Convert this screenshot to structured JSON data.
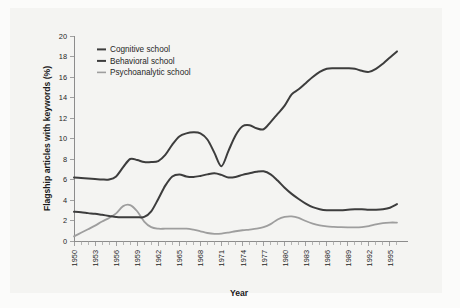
{
  "figure": {
    "background_color": "#f4f4f2",
    "page_color": "#fbfbfa"
  },
  "chart_data": {
    "type": "line",
    "title": "",
    "subtitle": "",
    "xlabel": "Year",
    "ylabel": "Flagship articles with keywords (%)",
    "xlim": [
      1950,
      1997
    ],
    "ylim": [
      0,
      20
    ],
    "yticks": [
      0,
      2,
      4,
      6,
      8,
      10,
      12,
      14,
      16,
      18,
      20
    ],
    "ytick_labels": [
      "0",
      "2",
      "4",
      "6",
      "8",
      "10",
      "12",
      "14",
      "16",
      "18",
      "20"
    ],
    "xticks": [
      1950,
      1953,
      1956,
      1959,
      1962,
      1965,
      1968,
      1971,
      1974,
      1977,
      1980,
      1983,
      1986,
      1989,
      1992,
      1995
    ],
    "xtick_labels": [
      "1950",
      "1953",
      "1956",
      "1959",
      "1962",
      "1965",
      "1968",
      "1971",
      "1974",
      "1977",
      "1980",
      "1983",
      "1986",
      "1989",
      "1992",
      "1995"
    ],
    "xtick_minor_step": 1,
    "grid": false,
    "legend_position": "upper-left-inside",
    "x": [
      1950,
      1951,
      1952,
      1953,
      1954,
      1955,
      1956,
      1957,
      1958,
      1959,
      1960,
      1961,
      1962,
      1963,
      1964,
      1965,
      1966,
      1967,
      1968,
      1969,
      1970,
      1971,
      1972,
      1973,
      1974,
      1975,
      1976,
      1977,
      1978,
      1979,
      1980,
      1981,
      1982,
      1983,
      1984,
      1985,
      1986,
      1987,
      1988,
      1989,
      1990,
      1991,
      1992,
      1993,
      1994,
      1995,
      1996
    ],
    "series": [
      {
        "name": "Cognitive school",
        "color": "#3d3d3d",
        "width": 2.0,
        "values": [
          6.2,
          6.15,
          6.1,
          6.05,
          6.0,
          6.0,
          6.3,
          7.2,
          8.0,
          7.9,
          7.7,
          7.7,
          7.8,
          8.4,
          9.4,
          10.2,
          10.5,
          10.6,
          10.5,
          9.9,
          8.6,
          7.3,
          8.8,
          10.3,
          11.2,
          11.3,
          11.0,
          10.9,
          11.6,
          12.4,
          13.2,
          14.3,
          14.8,
          15.4,
          16.0,
          16.5,
          16.8,
          16.85,
          16.85,
          16.85,
          16.8,
          16.6,
          16.5,
          16.8,
          17.3,
          17.9,
          18.5
        ]
      },
      {
        "name": "Behavioral school",
        "color": "#3d3d3d",
        "width": 2.0,
        "values": [
          2.85,
          2.8,
          2.72,
          2.65,
          2.55,
          2.45,
          2.35,
          2.32,
          2.32,
          2.32,
          2.35,
          2.9,
          4.1,
          5.4,
          6.3,
          6.5,
          6.3,
          6.25,
          6.35,
          6.5,
          6.6,
          6.45,
          6.2,
          6.25,
          6.45,
          6.6,
          6.75,
          6.8,
          6.5,
          5.9,
          5.2,
          4.6,
          4.1,
          3.65,
          3.3,
          3.1,
          3.0,
          3.0,
          3.0,
          3.05,
          3.1,
          3.1,
          3.05,
          3.05,
          3.1,
          3.25,
          3.6
        ]
      },
      {
        "name": "Psychoanalytic school",
        "color": "#9e9e9e",
        "width": 1.8,
        "values": [
          0.45,
          0.8,
          1.15,
          1.5,
          1.9,
          2.25,
          2.7,
          3.4,
          3.5,
          2.9,
          1.9,
          1.35,
          1.2,
          1.2,
          1.2,
          1.2,
          1.2,
          1.1,
          0.95,
          0.78,
          0.7,
          0.72,
          0.82,
          0.95,
          1.05,
          1.12,
          1.2,
          1.35,
          1.65,
          2.1,
          2.35,
          2.4,
          2.25,
          1.95,
          1.7,
          1.52,
          1.42,
          1.38,
          1.35,
          1.33,
          1.32,
          1.35,
          1.45,
          1.62,
          1.75,
          1.8,
          1.8
        ]
      }
    ],
    "legend": [
      {
        "label": "Cognitive school",
        "color": "#3d3d3d"
      },
      {
        "label": "Behavioral school",
        "color": "#3d3d3d"
      },
      {
        "label": "Psychoanalytic school",
        "color": "#9e9e9e"
      }
    ]
  }
}
